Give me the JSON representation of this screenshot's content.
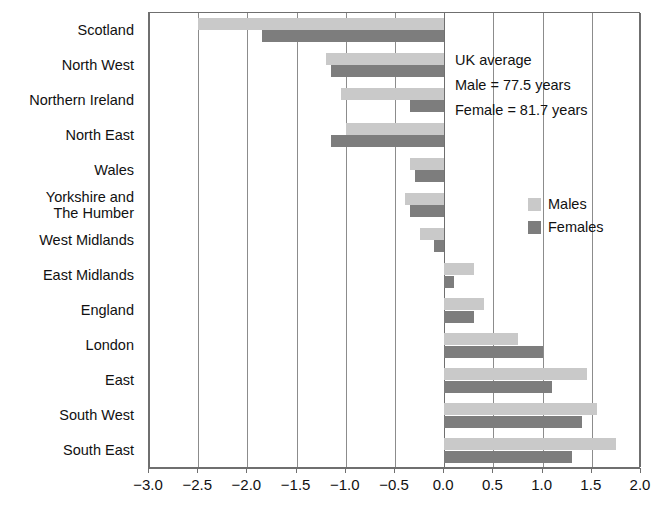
{
  "chart_data": {
    "type": "bar",
    "orientation": "horizontal",
    "title": "",
    "subtitle": "",
    "xlabel": "",
    "ylabel": "",
    "xlim": [
      -3.0,
      2.0
    ],
    "xticks": [
      "-3.0",
      "-2.5",
      "-2.0",
      "-1.5",
      "-1.0",
      "-0.5",
      "0.0",
      "0.5",
      "1.0",
      "1.5",
      "2.0"
    ],
    "xtick_values": [
      -3.0,
      -2.5,
      -2.0,
      -1.5,
      -1.0,
      -0.5,
      0.0,
      0.5,
      1.0,
      1.5,
      2.0
    ],
    "grid": true,
    "grid_axis": "x",
    "legend_position": "inside-right",
    "categories": [
      "Scotland",
      "North West",
      "Northern Ireland",
      "North East",
      "Wales",
      "Yorkshire and\nThe Humber",
      "West Midlands",
      "East Midlands",
      "England",
      "London",
      "East",
      "South West",
      "South East"
    ],
    "series": [
      {
        "name": "Males",
        "color": "#c9c9c9",
        "values": [
          -2.5,
          -1.2,
          -1.05,
          -1.0,
          -0.35,
          -0.4,
          -0.25,
          0.3,
          0.4,
          0.75,
          1.45,
          1.55,
          1.75
        ]
      },
      {
        "name": "Females",
        "color": "#7d7d7d",
        "values": [
          -1.85,
          -1.15,
          -0.35,
          -1.15,
          -0.3,
          -0.35,
          -0.1,
          0.1,
          0.3,
          1.0,
          1.1,
          1.4,
          1.3
        ]
      }
    ]
  },
  "annotation": {
    "line1": "UK average",
    "line2": "Male = 77.5 years",
    "line3": "Female = 81.7 years"
  },
  "legend": {
    "items": [
      {
        "label": "Males",
        "color": "#c9c9c9"
      },
      {
        "label": "Females",
        "color": "#7d7d7d"
      }
    ]
  },
  "colors": {
    "male_bar": "#c9c9c9",
    "female_bar": "#7d7d7d",
    "axis": "#6f6f6f",
    "grid": "#8c8c8c",
    "text": "#111111",
    "background": "#ffffff"
  }
}
